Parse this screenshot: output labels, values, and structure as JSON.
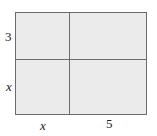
{
  "diagram": {
    "type": "area-model",
    "labels": {
      "left_top": "3",
      "left_bottom": "x",
      "bottom_left": "x",
      "bottom_right": "5"
    },
    "colors": {
      "fill": "#ebebeb",
      "stroke": "#6b6b6b"
    }
  }
}
